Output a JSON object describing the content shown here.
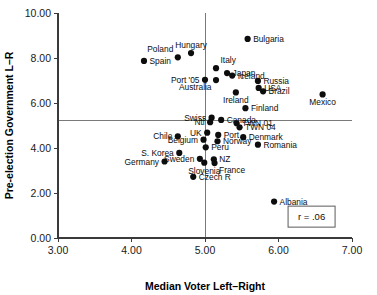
{
  "chart_data": {
    "type": "scatter",
    "title": "",
    "xlabel": "Median Voter Left–Right",
    "ylabel": "Pre-election Government L–R",
    "xlim": [
      3.0,
      7.0
    ],
    "ylim": [
      0.0,
      10.0
    ],
    "xticks": [
      3.0,
      4.0,
      5.0,
      6.0,
      7.0
    ],
    "yticks": [
      0.0,
      2.0,
      4.0,
      6.0,
      8.0,
      10.0
    ],
    "xtick_labels": [
      "3.00",
      "4.00",
      "5.00",
      "6.00",
      "7.00"
    ],
    "ytick_labels": [
      "0.00",
      "2.00",
      "4.00",
      "6.00",
      "8.00",
      "10.00"
    ],
    "grid": false,
    "legend": "none",
    "reference_lines": [
      {
        "axis": "vertical",
        "value": 5.0
      },
      {
        "axis": "horizontal",
        "value": 5.22
      }
    ],
    "annotations": [
      {
        "name": "correlation",
        "text": "r = .06",
        "x": 6.45,
        "y": 0.95
      }
    ],
    "points": [
      {
        "label": "Bulgaria",
        "x": 5.58,
        "y": 8.85,
        "label_pos": "right"
      },
      {
        "label": "Poland",
        "x": 4.63,
        "y": 8.03,
        "label_pos": "above-left"
      },
      {
        "label": "Hungary",
        "x": 4.81,
        "y": 8.22,
        "label_pos": "above"
      },
      {
        "label": "Spain",
        "x": 4.17,
        "y": 7.87,
        "label_pos": "right"
      },
      {
        "label": "Italy",
        "x": 5.15,
        "y": 7.55,
        "label_pos": "above-right"
      },
      {
        "label": "Japan",
        "x": 5.3,
        "y": 7.33,
        "label_pos": "right"
      },
      {
        "label": "Port '05",
        "x": 5.0,
        "y": 7.03,
        "label_pos": "left"
      },
      {
        "label": "Iceland",
        "x": 5.37,
        "y": 7.22,
        "label_pos": "right"
      },
      {
        "label": "Russia",
        "x": 5.72,
        "y": 6.98,
        "label_pos": "right"
      },
      {
        "label": "USA",
        "x": 5.73,
        "y": 6.67,
        "label_pos": "right"
      },
      {
        "label": "Brazil",
        "x": 5.79,
        "y": 6.52,
        "label_pos": "right"
      },
      {
        "label": "Mexico",
        "x": 6.6,
        "y": 6.38,
        "label_pos": "below"
      },
      {
        "label": "Australia",
        "x": 5.15,
        "y": 7.02,
        "label_pos": "below-left"
      },
      {
        "label": "Ireland",
        "x": 5.42,
        "y": 6.47,
        "label_pos": "below"
      },
      {
        "label": "Finland",
        "x": 5.55,
        "y": 5.77,
        "label_pos": "right"
      },
      {
        "label": "Swiss",
        "x": 5.09,
        "y": 5.35,
        "label_pos": "left"
      },
      {
        "label": "Canada",
        "x": 5.22,
        "y": 5.25,
        "label_pos": "right"
      },
      {
        "label": "Ntl",
        "x": 5.07,
        "y": 5.15,
        "label_pos": "left"
      },
      {
        "label": "TWN 01",
        "x": 5.43,
        "y": 5.1,
        "label_pos": "right"
      },
      {
        "label": "TWN 04",
        "x": 5.47,
        "y": 4.92,
        "label_pos": "right"
      },
      {
        "label": "UK",
        "x": 5.03,
        "y": 4.68,
        "label_pos": "left"
      },
      {
        "label": "Chile",
        "x": 4.63,
        "y": 4.52,
        "label_pos": "left"
      },
      {
        "label": "Port",
        "x": 5.18,
        "y": 4.58,
        "label_pos": "right"
      },
      {
        "label": "Denmark",
        "x": 5.52,
        "y": 4.48,
        "label_pos": "right"
      },
      {
        "label": "Belgium",
        "x": 4.98,
        "y": 4.37,
        "label_pos": "left"
      },
      {
        "label": "Norway",
        "x": 5.17,
        "y": 4.3,
        "label_pos": "right"
      },
      {
        "label": "Romania",
        "x": 5.72,
        "y": 4.15,
        "label_pos": "right"
      },
      {
        "label": "Peru",
        "x": 5.01,
        "y": 4.03,
        "label_pos": "right"
      },
      {
        "label": "S. Korea",
        "x": 4.65,
        "y": 3.78,
        "label_pos": "left"
      },
      {
        "label": "Sweden",
        "x": 4.93,
        "y": 3.52,
        "label_pos": "left"
      },
      {
        "label": "NZ",
        "x": 5.12,
        "y": 3.5,
        "label_pos": "right"
      },
      {
        "label": "Germany",
        "x": 4.45,
        "y": 3.4,
        "label_pos": "left"
      },
      {
        "label": "Slovenia",
        "x": 4.99,
        "y": 3.35,
        "label_pos": "below"
      },
      {
        "label": "France",
        "x": 5.13,
        "y": 3.33,
        "label_pos": "below-right"
      },
      {
        "label": "Czech R",
        "x": 4.84,
        "y": 2.72,
        "label_pos": "right"
      },
      {
        "label": "Albania",
        "x": 5.94,
        "y": 1.62,
        "label_pos": "right"
      }
    ]
  }
}
